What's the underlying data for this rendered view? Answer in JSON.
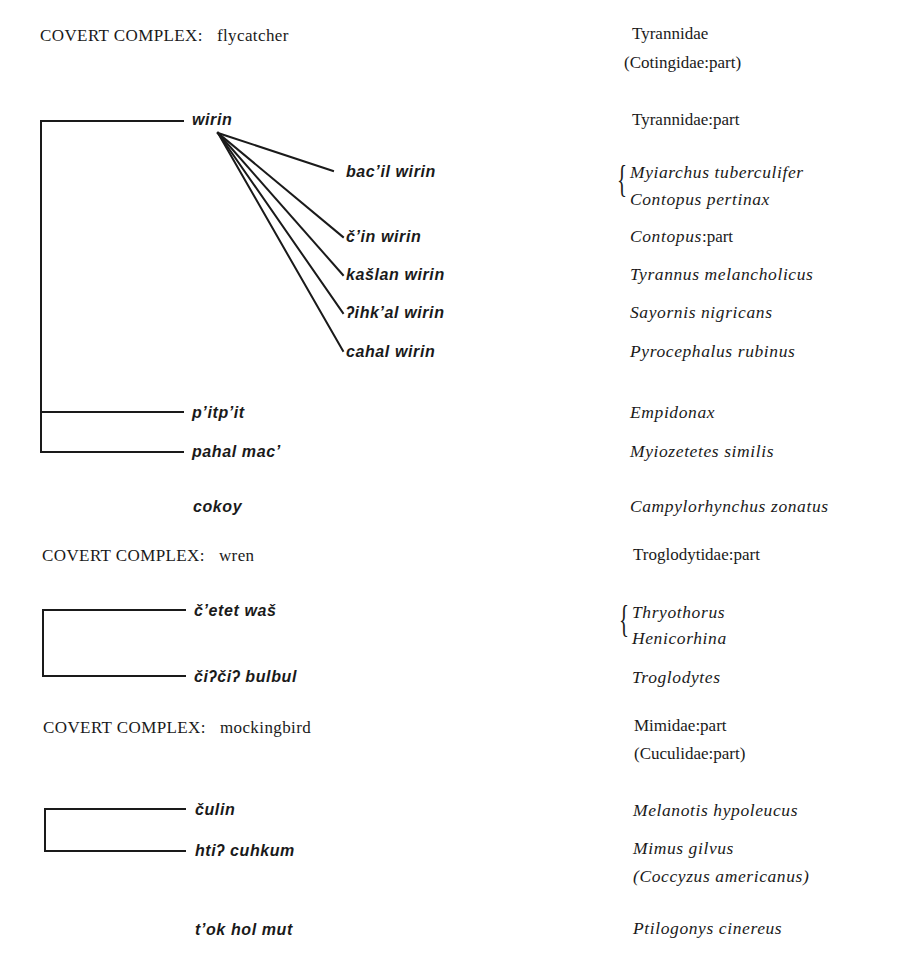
{
  "complexes": [
    {
      "label": "COVERT COMPLEX:",
      "name": "flycatcher",
      "family": "Tyrannidae",
      "family_note": "(Cotingidae:part)"
    },
    {
      "label": "COVERT COMPLEX:",
      "name": "wren",
      "family": "Troglodytidae:part"
    },
    {
      "label": "COVERT COMPLEX:",
      "name": "mockingbird",
      "family": "Mimidae:part",
      "family_note": "(Cuculidae:part)"
    }
  ],
  "flycatcher": {
    "wirin": {
      "term": "wirin",
      "taxon": "Tyrannidae:part"
    },
    "wirin_subtypes": [
      {
        "term": "bac’il wirin",
        "taxa": [
          "Myiarchus tuberculifer",
          "Contopus pertinax"
        ]
      },
      {
        "term": "č’in wirin",
        "taxon_italic": "Contopus",
        "taxon_suffix": ":part"
      },
      {
        "term": "kašlan wirin",
        "taxon": "Tyrannus melancholicus"
      },
      {
        "term": "ʔihk’al wirin",
        "taxon": "Sayornis nigricans"
      },
      {
        "term": "cahal wirin",
        "taxon": "Pyrocephalus rubinus"
      }
    ],
    "others": [
      {
        "term": "p’itp’it",
        "taxon": "Empidonax"
      },
      {
        "term": "pahal mac’",
        "taxon": "Myiozetetes similis"
      }
    ]
  },
  "standalone_1": {
    "term": "cokoy",
    "taxon": "Campylorhynchus zonatus"
  },
  "wren": {
    "items": [
      {
        "term": "č’etet waš",
        "taxa": [
          "Thryothorus",
          "Henicorhina"
        ]
      },
      {
        "term": "čiʔčiʔ bulbul",
        "taxon": "Troglodytes"
      }
    ]
  },
  "mockingbird": {
    "items": [
      {
        "term": "čulin",
        "taxon": "Melanotis hypoleucus"
      },
      {
        "term": "htiʔ cuhkum",
        "taxon": "Mimus gilvus",
        "taxon_note": "(Coccyzus americanus)"
      }
    ]
  },
  "standalone_2": {
    "term": "t’ok hol mut",
    "taxon": "Ptilogonys cinereus"
  },
  "colors": {
    "ink": "#1a1a1a",
    "background": "#ffffff"
  }
}
